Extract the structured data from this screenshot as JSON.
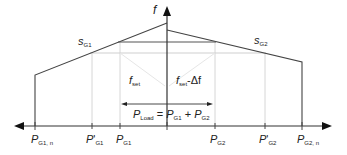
{
  "diagram": {
    "axes": {
      "vertical_label": "f",
      "horizontal_left_label": "P_G1,n",
      "horizontal_right_label": "P_G2,n"
    },
    "labels": {
      "f_axis": "f",
      "s_g1_main": "s",
      "s_g1_sub": "G1",
      "s_g2_main": "s",
      "s_g2_sub": "G2",
      "fset_main": "f",
      "fset_sub": "set",
      "fset_df_main": "f",
      "fset_df_sub": "set",
      "fset_df_suffix": "-Δf",
      "pload_main": "P",
      "pload_sub": "Load",
      "pload_eq": " = ",
      "pload_p1": "P",
      "pload_p1_sub": "G1",
      "pload_plus": " + ",
      "pload_p2": "P",
      "pload_p2_sub": "G2"
    },
    "ticks": [
      {
        "main": "P",
        "prime": "",
        "sub": "G1, n"
      },
      {
        "main": "P",
        "prime": "'",
        "sub": "G1"
      },
      {
        "main": "P",
        "prime": "",
        "sub": "G1"
      },
      {
        "main": "P",
        "prime": "",
        "sub": "G2"
      },
      {
        "main": "P",
        "prime": "'",
        "sub": "G2"
      },
      {
        "main": "P",
        "prime": "",
        "sub": "G2, n"
      }
    ],
    "colors": {
      "line": "#333333",
      "grid": "#d0d0d0",
      "text": "#222222"
    }
  }
}
